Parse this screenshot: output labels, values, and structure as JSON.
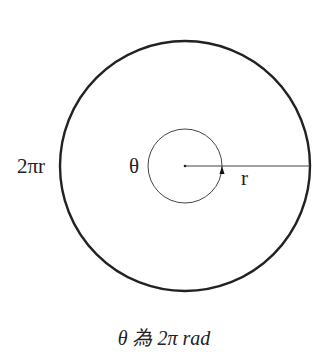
{
  "diagram": {
    "labels": {
      "circumference": "2πr",
      "angle": "θ",
      "radius": "r"
    },
    "caption": "θ 為 2π rad",
    "elements": {
      "outer_circle": {
        "cx": 185,
        "cy": 166,
        "r": 125
      },
      "inner_circle": {
        "cx": 185,
        "cy": 166,
        "r": 37
      },
      "radius_line": {
        "x1": 185,
        "y1": 166,
        "x2": 311,
        "y2": 166
      }
    },
    "colors": {
      "stroke": "#222222",
      "background": "#ffffff"
    }
  }
}
